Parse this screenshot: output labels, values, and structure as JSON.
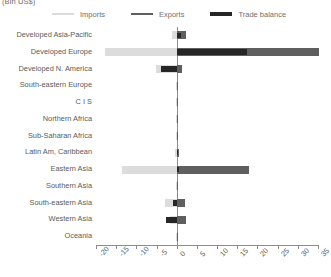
{
  "chart": {
    "title": "(Bln US$)",
    "legend": [
      {
        "label": "Imports",
        "color": "#dcdcdc",
        "key": "imports"
      },
      {
        "label": "Exports",
        "color": "#5f5f5f",
        "key": "exports"
      },
      {
        "label": "Trade balance",
        "color": "#262626",
        "key": "balance"
      }
    ]
  },
  "chart_data": {
    "type": "bar",
    "orientation": "horizontal",
    "title": "(Bln US$)",
    "xlabel": "",
    "ylabel": "",
    "xlim": [
      -20,
      35
    ],
    "xticks": [
      -20,
      -15,
      -10,
      -5,
      0,
      5,
      10,
      15,
      20,
      25,
      30,
      35
    ],
    "xticklabels": [
      "-20",
      "-15",
      "-10",
      "-5",
      "0",
      "5",
      "10",
      "15",
      "20",
      "25",
      "30",
      "35"
    ],
    "grid": false,
    "legend_position": "top",
    "categories": [
      "Developed Asia-Pacific",
      "Developed Europe",
      "Developed N. America",
      "South-eastern Europe",
      "C I S",
      "Northern Africa",
      "Sub-Saharan Africa",
      "Latin Am, Caribbean",
      "Eastern Asia",
      "Southern Asia",
      "South-eastern Asia",
      "Western Asia",
      "Oceania"
    ],
    "series": [
      {
        "name": "Imports",
        "color": "#dcdcdc",
        "values": [
          -1.2,
          -17.8,
          -5.2,
          -0.1,
          -0.1,
          -0.1,
          -0.1,
          -0.4,
          -13.6,
          -0.2,
          -2.9,
          -1.6,
          -0.1
        ]
      },
      {
        "name": "Exports",
        "color": "#5f5f5f",
        "values": [
          2.2,
          35.2,
          1.4,
          0.1,
          0.1,
          0.1,
          0.1,
          0.6,
          17.8,
          0.2,
          2.1,
          2.4,
          0.1
        ]
      },
      {
        "name": "Trade balance",
        "color": "#262626",
        "values": [
          1.1,
          17.4,
          -3.8,
          0.0,
          0.0,
          0.0,
          0.0,
          0.2,
          0.6,
          0.0,
          -0.8,
          -2.6,
          0.0
        ]
      }
    ]
  }
}
